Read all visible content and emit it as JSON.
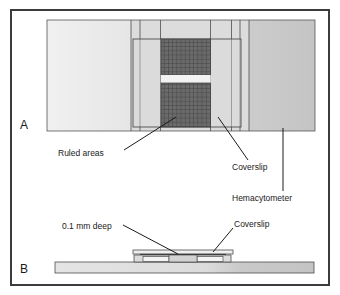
{
  "figure": {
    "panels": [
      {
        "id": "A",
        "letter": "A",
        "view": "top view of hemacytometer with coverslip"
      },
      {
        "id": "B",
        "letter": "B",
        "view": "side cross-section view"
      }
    ],
    "labels": {
      "ruled_areas": "Ruled areas",
      "coverslip_top": "Coverslip",
      "hemacytometer": "Hemacytometer",
      "depth": "0.1 mm deep",
      "coverslip_side": "Coverslip"
    },
    "colors": {
      "border": "#3c3c3c",
      "outline": "#4d4d4d",
      "leader_line": "#1a1a1a",
      "text": "#1a1a1a",
      "slide_left": "#ededed",
      "slide_center": "#dcdcdc",
      "slide_right": "#c9c9c9",
      "coverslip_fill": "#d7d7d7",
      "ruled_fill": "#6e6e6e",
      "ruled_grid": "#3f3f3f",
      "chamber_gap": "#f2f2f2",
      "side_slide_fill": "#dedede",
      "side_slide_fill_right": "#c9c9c9",
      "side_coverslip_fill": "#eeeeee",
      "background": "#ffffff"
    },
    "geometry": {
      "panel_a": {
        "slide_rect": {
          "x": 47,
          "y": 20,
          "w": 268,
          "h": 111
        },
        "left_band_end": 131,
        "right_band_start": 249,
        "vertical_rule_lines": [
          131,
          140,
          160,
          210,
          232,
          240,
          249
        ],
        "coverslip_rect": {
          "x": 133,
          "y": 39,
          "w": 108,
          "h": 88
        },
        "ruled_upper": {
          "x": 161,
          "y": 39,
          "w": 49,
          "h": 36
        },
        "ruled_lower": {
          "x": 161,
          "y": 83,
          "w": 49,
          "h": 44
        },
        "chamber_gap": {
          "x": 161,
          "y": 75,
          "w": 49,
          "h": 8
        }
      },
      "panel_b": {
        "base_slide": {
          "x": 55,
          "y": 262,
          "w": 259,
          "h": 11
        },
        "raised_platform": {
          "x": 134,
          "y": 254,
          "w": 98,
          "h": 9
        },
        "coverslip_bar": {
          "x": 133,
          "y": 250,
          "w": 100,
          "h": 4
        }
      }
    }
  }
}
